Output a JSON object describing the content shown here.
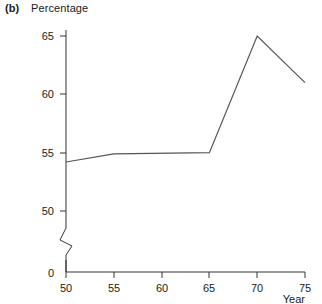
{
  "figure": {
    "panel_letter": "(b)",
    "y_axis_title": "Percentage",
    "x_axis_title": "Year"
  },
  "chart_data": {
    "type": "line",
    "title": "Percentage",
    "panel": "(b)",
    "xlabel": "Year",
    "ylabel": "Percentage",
    "x": [
      50,
      55,
      65,
      70,
      75
    ],
    "values": [
      54.2,
      54.9,
      55.0,
      65.0,
      61.0
    ],
    "series": [
      {
        "name": "Percentage",
        "values": [
          54.2,
          54.9,
          55.0,
          65.0,
          61.0
        ]
      }
    ],
    "xlim": [
      50,
      75
    ],
    "ylim": [
      0,
      67
    ],
    "x_ticks": [
      "50",
      "55",
      "60",
      "65",
      "70",
      "75"
    ],
    "x_tick_values": [
      50,
      55,
      60,
      65,
      70,
      75
    ],
    "y_ticks": [
      "0",
      "50",
      "55",
      "60",
      "65"
    ],
    "y_tick_values": [
      0,
      50,
      55,
      60,
      65
    ],
    "axis_break": true,
    "axis_break_between": [
      0,
      50
    ],
    "grid": false,
    "legend": "none",
    "line_color": "#555555"
  }
}
